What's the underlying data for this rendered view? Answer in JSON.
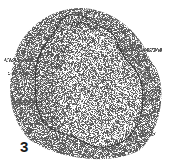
{
  "figure": {
    "label": "3",
    "colors": {
      "ink": "#1a1a1a",
      "background": "#ffffff"
    }
  }
}
